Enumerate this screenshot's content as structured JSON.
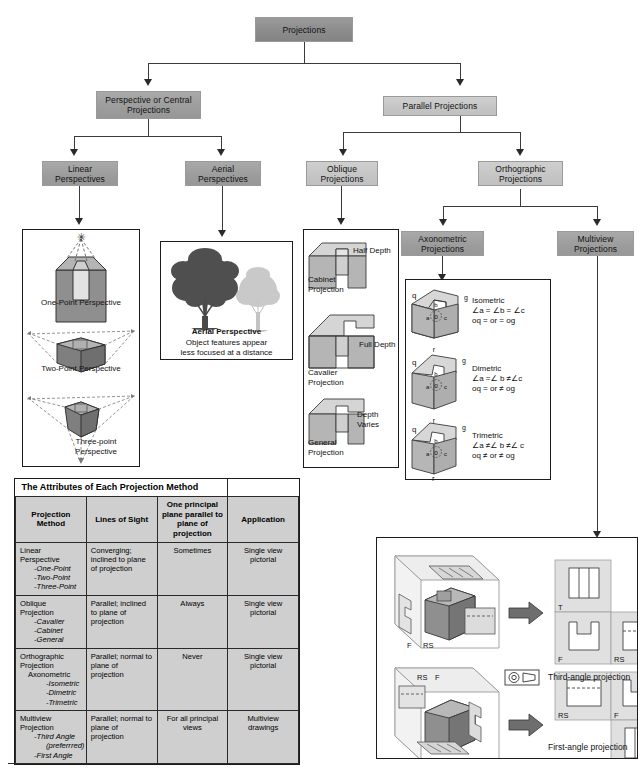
{
  "flowchart": {
    "root": "Projections",
    "level2": [
      "Perspective or Central Projections",
      "Parallel Projections"
    ],
    "level3": [
      "Linear Perspectives",
      "Aerial Perspectives",
      "Oblique Projections",
      "Orthographic Projections"
    ],
    "level4": [
      "Axonometric Projections",
      "Multiview Projections"
    ]
  },
  "panels": {
    "linear": {
      "items": [
        {
          "label": "One-Point Perspective"
        },
        {
          "label": "Two-Point Perspective"
        },
        {
          "label": "Three-point Perspective"
        }
      ]
    },
    "aerial": {
      "title": "Aerial Perspective",
      "line1": "Object features appear",
      "line2": "less focused at a distance"
    },
    "oblique": {
      "items": [
        {
          "depth": "Half Depth",
          "name": "Cabinet Projection"
        },
        {
          "depth": "Full Depth",
          "name": "Cavalier Projection"
        },
        {
          "depth": "Depth Varies",
          "name": "General Projection"
        }
      ],
      "vertex_labels": {
        "q": "q",
        "g": "g",
        "r": "r",
        "o": "o",
        "a": "a",
        "b": "b",
        "c": "c"
      }
    },
    "axonometric": {
      "items": [
        {
          "name": "Isometric",
          "angles": "∠a = ∠b = ∠c",
          "lengths": "oq = or = og"
        },
        {
          "name": "Dimetric",
          "angles": "∠a =∠ b ≠∠c",
          "lengths": "oq = or ≠ og"
        },
        {
          "name": "Trimetric",
          "angles": "∠a ≠∠ b ≠∠ c",
          "lengths": "oq ≠ or ≠ og"
        }
      ],
      "vertex_labels": {
        "q": "q",
        "g": "g",
        "r": "r",
        "o": "o",
        "a": "a",
        "b": "b",
        "c": "c"
      }
    },
    "multiview": {
      "third": {
        "caption": "Third-angle projection",
        "views": [
          "T",
          "F",
          "RS"
        ],
        "pictorial_labels": [
          "F",
          "RS"
        ]
      },
      "first": {
        "caption": "First-angle projection",
        "views": [
          "RS",
          "F",
          "T"
        ],
        "pictorial_labels": [
          "RS",
          "F"
        ]
      }
    }
  },
  "table": {
    "title": "The Attributes of Each Projection Method",
    "headers": [
      "Projection Method",
      "Lines of Sight",
      "One principal plane parallel to plane of projection",
      "Application"
    ],
    "rows": [
      {
        "method": "Linear Perspective",
        "subs": [
          "-One-Point",
          "-Two-Point",
          "-Three-Point"
        ],
        "sight": "Converging; inclined to plane of projection",
        "principal": "Sometimes",
        "application": "Single view pictorial"
      },
      {
        "method": "Oblique Projection",
        "subs": [
          "-Cavalier",
          "-Cabinet",
          "-General"
        ],
        "sight": "Parallel; inclined to plane of projection",
        "principal": "Always",
        "application": "Single view pictorial"
      },
      {
        "method": "Orthographic Projection",
        "group": "Axonometric",
        "subs": [
          "-Isometric",
          "-Dimetric",
          "-Trimetric"
        ],
        "sight": "Parallel; normal to plane of projection",
        "principal": "Never",
        "application": "Single view pictorial"
      },
      {
        "method": "Multiview Projection",
        "subs": [
          "-Third Angle",
          "(preferrred)",
          "-First Angle"
        ],
        "sight": "Parallel; normal to plane of projection",
        "principal": "For all principal views",
        "application": "Multiview drawings"
      }
    ]
  },
  "colors": {
    "box_dark": "#8c8c8c",
    "box_mid": "#9d9d9d",
    "box_light": "#c6c6c6",
    "line": "#3a3a3a",
    "panel_border": "#1c1c1c",
    "cell_fill": "#cfcfcf"
  }
}
